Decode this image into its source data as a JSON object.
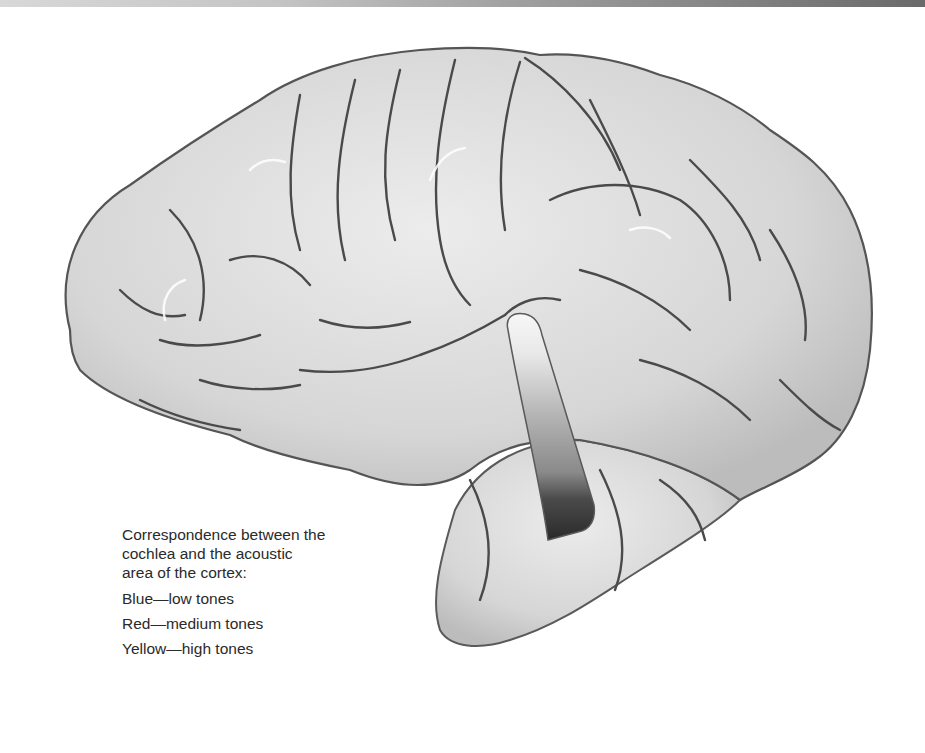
{
  "figure": {
    "caption": {
      "intro_lines": [
        "Correspondence between the",
        "cochlea and the acoustic",
        "area of the cortex:"
      ],
      "legend": [
        {
          "color_name": "Blue",
          "separator": "—",
          "meaning": "low tones",
          "label": "Blue—low tones"
        },
        {
          "color_name": "Red",
          "separator": "—",
          "meaning": "medium tones",
          "label": "Red—medium tones"
        },
        {
          "color_name": "Yellow",
          "separator": "—",
          "meaning": "high tones",
          "label": "Yellow—high tones"
        }
      ]
    },
    "colors": {
      "brain_fill": "#d9d9d9",
      "brain_outline": "#555555",
      "sulci": "#4a4a4a",
      "acoustic_strip_top": "#f4f4f4",
      "acoustic_strip_bottom": "#2e2e2e",
      "text": "#2a2a2a"
    }
  }
}
